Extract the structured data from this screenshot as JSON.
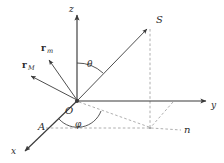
{
  "figure": {
    "background_color": "#ffffff",
    "stroke_color": "#3a3a3a",
    "dash_color": "#8c8c8c",
    "label_color": "#2b2b2b"
  },
  "axes": [
    {
      "name": "z-axis",
      "label": "z",
      "from": [
        77,
        101
      ],
      "to": [
        77,
        13
      ],
      "style": "solid-arrow"
    },
    {
      "name": "y-axis",
      "label": "y",
      "from": [
        77,
        101
      ],
      "to": [
        208,
        101
      ],
      "style": "solid-arrow"
    },
    {
      "name": "x-axis",
      "label": "x",
      "from": [
        77,
        101
      ],
      "to": [
        23,
        153
      ],
      "style": "solid-arrow"
    }
  ],
  "points": [
    {
      "name": "origin",
      "label": "O",
      "at": [
        77,
        101
      ]
    },
    {
      "name": "source-point",
      "label": "S",
      "at": [
        150,
        26
      ]
    },
    {
      "name": "point-a-on-x-axis",
      "label": "A",
      "at": [
        45,
        128
      ]
    },
    {
      "name": "node-point",
      "label": "n",
      "at": [
        187,
        128
      ]
    }
  ],
  "angles": [
    {
      "name": "polar-angle",
      "label": "θ",
      "between": [
        "z-axis",
        "ray-OS"
      ]
    },
    {
      "name": "azimuthal-angle",
      "label": "φ",
      "between": [
        "x-axis",
        "ground-projection"
      ]
    }
  ],
  "vectors": [
    {
      "name": "vector-r-m",
      "symbol": "r",
      "subscript": "m",
      "from": [
        77,
        101
      ],
      "to": [
        46,
        57
      ]
    },
    {
      "name": "vector-r-M",
      "symbol": "r",
      "subscript": "M",
      "from": [
        77,
        101
      ],
      "to": [
        27,
        74
      ]
    }
  ],
  "rays": [
    {
      "name": "ray-OS",
      "from": [
        77,
        101
      ],
      "to": [
        150,
        26
      ],
      "style": "solid-arrow"
    }
  ],
  "dashed_lines": [
    {
      "name": "vertical-drop-from-S",
      "from": [
        150,
        26
      ],
      "to": [
        150,
        128
      ]
    },
    {
      "name": "ground-projection-line",
      "from": [
        77,
        101
      ],
      "to": [
        150,
        128
      ]
    },
    {
      "name": "line-A-to-projection",
      "from": [
        45,
        128
      ],
      "to": [
        150,
        128
      ]
    },
    {
      "name": "projection-to-n",
      "from": [
        150,
        128
      ],
      "to": [
        185,
        130
      ]
    },
    {
      "name": "y-axis-tick-to-ground",
      "from": [
        173,
        101
      ],
      "to": [
        150,
        128
      ]
    }
  ]
}
